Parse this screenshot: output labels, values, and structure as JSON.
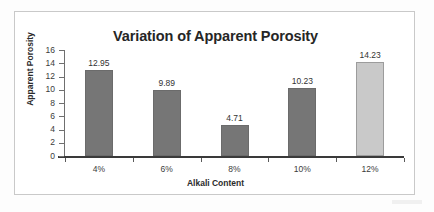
{
  "chart_data": {
    "type": "bar",
    "title": "Variation of Apparent Porosity",
    "xlabel": "Alkali Content",
    "ylabel": "Apparent Porosity",
    "categories": [
      "4%",
      "6%",
      "8%",
      "10%",
      "12%"
    ],
    "values": [
      12.95,
      9.89,
      4.71,
      10.23,
      14.23
    ],
    "value_labels": [
      "12.95",
      "9.89",
      "4.71",
      "10.23",
      "14.23"
    ],
    "bar_colors": [
      "#767676",
      "#767676",
      "#767676",
      "#767676",
      "#c9c9c9"
    ],
    "ylim": [
      0,
      16
    ],
    "ytick_values": [
      16,
      14,
      12,
      10,
      8,
      6,
      4,
      2,
      0
    ],
    "ytick_labels": [
      "16",
      "14",
      "12",
      "10",
      "8",
      "6",
      "4",
      "2",
      "0"
    ],
    "grid": false,
    "legend": null,
    "legend_position": "none",
    "series": [
      {
        "name": "Apparent Porosity",
        "values": [
          12.95,
          9.89,
          4.71,
          10.23,
          14.23
        ]
      }
    ]
  },
  "colors": {
    "bar_dark": "#767676",
    "bar_light": "#c9c9c9",
    "frame_border": "#c9c9c9",
    "axis": "#3a3a3a",
    "text": "#333333",
    "background": "#ffffff"
  }
}
